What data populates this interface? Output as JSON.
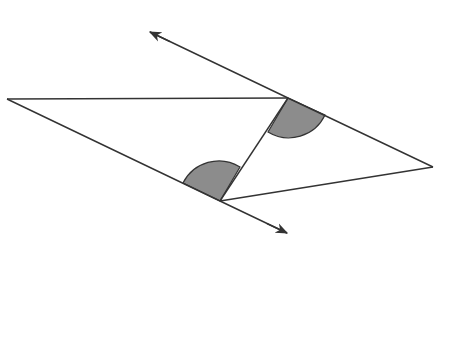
{
  "diagram": {
    "type": "geometry",
    "colors": {
      "stroke": "#333333",
      "shade": "#8c8c8c",
      "background": "#ffffff"
    },
    "points": {
      "left": [
        7,
        99
      ],
      "top": [
        288,
        98
      ],
      "bottom": [
        220,
        201
      ],
      "right": [
        433,
        167
      ],
      "arrow_start": [
        150,
        32
      ],
      "arrow_end": [
        287,
        234
      ]
    },
    "shaded_angles": [
      {
        "vertex": "top",
        "label": ""
      },
      {
        "vertex": "bottom",
        "label": ""
      }
    ]
  }
}
